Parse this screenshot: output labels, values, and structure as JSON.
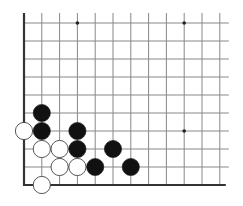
{
  "diagram": {
    "type": "go-board-fragment",
    "corner": "bottom-left",
    "visible_columns": 12,
    "visible_rows": 10,
    "grid": {
      "x_start": 24,
      "y_start": 23,
      "spacing_x": 17.8,
      "spacing_y": 18.0,
      "line_extend_top": 10,
      "line_extend_right": 9
    },
    "edges": [
      "left",
      "bottom"
    ],
    "colors": {
      "line": "#888888",
      "edge": "#333333",
      "black_stone": "#111111",
      "white_stone": "#ffffff",
      "white_outline": "#444444",
      "star_point": "#222222"
    },
    "star_points": [
      {
        "col": 3,
        "row": 0
      },
      {
        "col": 9,
        "row": 0
      },
      {
        "col": 9,
        "row": 6
      }
    ],
    "stones": [
      {
        "color": "black",
        "col": 1,
        "row": 5
      },
      {
        "color": "white",
        "col": 0,
        "row": 6
      },
      {
        "color": "black",
        "col": 1,
        "row": 6
      },
      {
        "color": "black",
        "col": 3,
        "row": 6
      },
      {
        "color": "white",
        "col": 1,
        "row": 7
      },
      {
        "color": "white",
        "col": 2,
        "row": 7
      },
      {
        "color": "black",
        "col": 3,
        "row": 7
      },
      {
        "color": "black",
        "col": 5,
        "row": 7
      },
      {
        "color": "white",
        "col": 2,
        "row": 8
      },
      {
        "color": "white",
        "col": 3,
        "row": 8
      },
      {
        "color": "black",
        "col": 4,
        "row": 8
      },
      {
        "color": "black",
        "col": 6,
        "row": 8
      },
      {
        "color": "white",
        "col": 1,
        "row": 9
      }
    ]
  }
}
